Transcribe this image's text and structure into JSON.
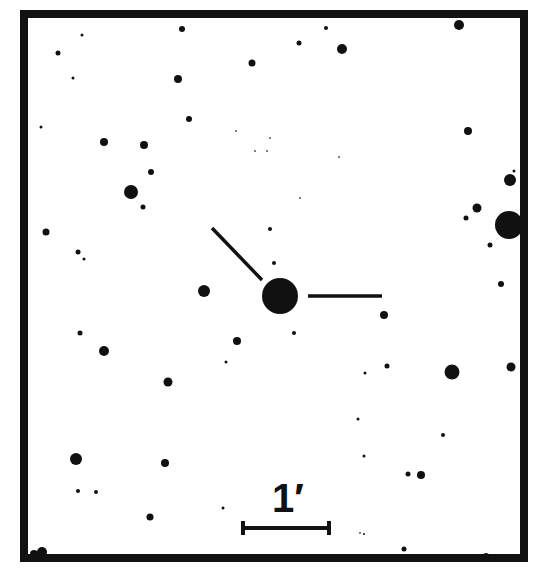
{
  "chart_data": {
    "type": "scatter",
    "title": "",
    "frame": {
      "x0": 24,
      "y0": 14,
      "x1": 524,
      "y1": 558,
      "stroke_width": 8,
      "color": "#111111"
    },
    "target": {
      "x": 280,
      "y": 296,
      "r": 18
    },
    "markers": [
      {
        "name": "diagonal-tick",
        "x1": 212,
        "y1": 228,
        "x2": 262,
        "y2": 280
      },
      {
        "name": "horizontal-tick",
        "x1": 308,
        "y1": 296,
        "x2": 382,
        "y2": 296
      }
    ],
    "scale_bar": {
      "label": "1′",
      "x1": 243,
      "x2": 329,
      "y": 528,
      "cap_height": 14
    },
    "stars": [
      {
        "x": 182,
        "y": 29,
        "r": 3
      },
      {
        "x": 82,
        "y": 35,
        "r": 1.5
      },
      {
        "x": 58,
        "y": 53,
        "r": 2.5
      },
      {
        "x": 252,
        "y": 63,
        "r": 3.5
      },
      {
        "x": 73,
        "y": 78,
        "r": 1.5
      },
      {
        "x": 178,
        "y": 79,
        "r": 4
      },
      {
        "x": 189,
        "y": 119,
        "r": 3
      },
      {
        "x": 41,
        "y": 127,
        "r": 1.5
      },
      {
        "x": 104,
        "y": 142,
        "r": 4
      },
      {
        "x": 144,
        "y": 145,
        "r": 4
      },
      {
        "x": 151,
        "y": 172,
        "r": 3
      },
      {
        "x": 131,
        "y": 192,
        "r": 7
      },
      {
        "x": 143,
        "y": 207,
        "r": 2.5
      },
      {
        "x": 46,
        "y": 232,
        "r": 3.5
      },
      {
        "x": 78,
        "y": 252,
        "r": 2.5
      },
      {
        "x": 84,
        "y": 259,
        "r": 1.5
      },
      {
        "x": 299,
        "y": 43,
        "r": 2.5
      },
      {
        "x": 326,
        "y": 28,
        "r": 2
      },
      {
        "x": 342,
        "y": 49,
        "r": 5
      },
      {
        "x": 459,
        "y": 25,
        "r": 5
      },
      {
        "x": 468,
        "y": 131,
        "r": 4
      },
      {
        "x": 510,
        "y": 180,
        "r": 6
      },
      {
        "x": 514,
        "y": 171,
        "r": 1.5
      },
      {
        "x": 477,
        "y": 208,
        "r": 4.5
      },
      {
        "x": 466,
        "y": 218,
        "r": 2.5
      },
      {
        "x": 509,
        "y": 225,
        "r": 14
      },
      {
        "x": 490,
        "y": 245,
        "r": 2.5
      },
      {
        "x": 501,
        "y": 284,
        "r": 3
      },
      {
        "x": 270,
        "y": 229,
        "r": 2
      },
      {
        "x": 274,
        "y": 263,
        "r": 2
      },
      {
        "x": 204,
        "y": 291,
        "r": 6
      },
      {
        "x": 384,
        "y": 315,
        "r": 4
      },
      {
        "x": 80,
        "y": 333,
        "r": 2.5
      },
      {
        "x": 294,
        "y": 333,
        "r": 2
      },
      {
        "x": 237,
        "y": 341,
        "r": 4
      },
      {
        "x": 104,
        "y": 351,
        "r": 5
      },
      {
        "x": 226,
        "y": 362,
        "r": 1.5
      },
      {
        "x": 387,
        "y": 366,
        "r": 2.5
      },
      {
        "x": 365,
        "y": 373,
        "r": 1.5
      },
      {
        "x": 452,
        "y": 372,
        "r": 7.5
      },
      {
        "x": 511,
        "y": 367,
        "r": 4.5
      },
      {
        "x": 168,
        "y": 382,
        "r": 4.5
      },
      {
        "x": 358,
        "y": 419,
        "r": 1.5
      },
      {
        "x": 443,
        "y": 435,
        "r": 2
      },
      {
        "x": 364,
        "y": 456,
        "r": 1.5
      },
      {
        "x": 76,
        "y": 459,
        "r": 6
      },
      {
        "x": 165,
        "y": 463,
        "r": 4
      },
      {
        "x": 408,
        "y": 474,
        "r": 2.5
      },
      {
        "x": 421,
        "y": 475,
        "r": 4
      },
      {
        "x": 78,
        "y": 491,
        "r": 2
      },
      {
        "x": 96,
        "y": 492,
        "r": 2
      },
      {
        "x": 223,
        "y": 508,
        "r": 1.5
      },
      {
        "x": 150,
        "y": 517,
        "r": 3.5
      },
      {
        "x": 404,
        "y": 549,
        "r": 2.5
      },
      {
        "x": 364,
        "y": 534,
        "r": 1
      },
      {
        "x": 42,
        "y": 552,
        "r": 5
      },
      {
        "x": 34,
        "y": 554,
        "r": 4
      },
      {
        "x": 486,
        "y": 556,
        "r": 3
      },
      {
        "x": 312,
        "y": 16,
        "r": 2
      }
    ],
    "faint_stars": [
      {
        "x": 236,
        "y": 131,
        "r": 1
      },
      {
        "x": 255,
        "y": 151,
        "r": 1
      },
      {
        "x": 267,
        "y": 151,
        "r": 1
      },
      {
        "x": 270,
        "y": 138,
        "r": 1
      },
      {
        "x": 300,
        "y": 198,
        "r": 1
      },
      {
        "x": 339,
        "y": 157,
        "r": 1
      },
      {
        "x": 360,
        "y": 533,
        "r": 1
      }
    ],
    "colors": {
      "ink": "#111111",
      "background": "#ffffff"
    }
  },
  "scale": {
    "label": "1′"
  }
}
